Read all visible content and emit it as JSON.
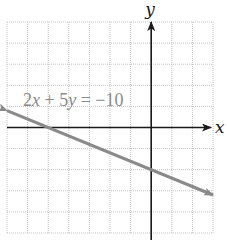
{
  "chart_data": {
    "type": "line",
    "title": "",
    "equation_label": "2x + 5y = −10",
    "equation_parts": [
      "2",
      "x",
      " + 5",
      "y",
      " = −10"
    ],
    "xlabel": "x",
    "ylabel": "y",
    "xlim": [
      -7,
      3
    ],
    "ylim": [
      -5,
      5
    ],
    "grid": true,
    "grid_spacing": 1,
    "series": [
      {
        "name": "2x + 5y = −10",
        "x": [
          -7,
          -5,
          0,
          3
        ],
        "y": [
          0.8,
          0,
          -2,
          -3.2
        ],
        "color": "#8a8a8a",
        "arrows": "both"
      }
    ],
    "intercepts": {
      "x_intercept": [
        -5,
        0
      ],
      "y_intercept": [
        0,
        -2
      ]
    }
  },
  "colors": {
    "axis": "#1a1a1a",
    "grid": "#c4c4c4",
    "line": "#8a8a8a",
    "label": "#8a8a8a"
  }
}
